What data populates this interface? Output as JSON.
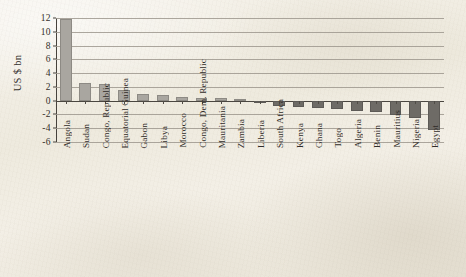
{
  "chart_data": {
    "type": "bar",
    "title": "",
    "subtitle": "",
    "xlabel": "",
    "ylabel": "US $ bn",
    "ylim": [
      -6,
      12
    ],
    "yticks": [
      12,
      10,
      8,
      6,
      4,
      2,
      0,
      -2,
      -4,
      -6
    ],
    "ytick_labels": [
      "12",
      "10",
      "8",
      "6",
      "4",
      "2",
      "0",
      "-2",
      "-4",
      "-6"
    ],
    "grid": true,
    "legend": false,
    "legend_position": "none",
    "categories": [
      "Angola",
      "Sudan",
      "Congo, Republic",
      "Equatorial Guinea",
      "Gabon",
      "Libya",
      "Morocco",
      "Congo, Dem. Republic",
      "Mauritania",
      "Zambia",
      "Liberia",
      "South Africa",
      "Kenya",
      "Ghana",
      "Togo",
      "Algeria",
      "Benin",
      "Mauritius",
      "Nigeria",
      "Egypt"
    ],
    "values": [
      11.8,
      2.6,
      2.4,
      1.5,
      1.0,
      0.8,
      0.6,
      0.45,
      0.35,
      0.2,
      -0.15,
      -0.8,
      -0.9,
      -1.0,
      -1.2,
      -1.5,
      -1.7,
      -2.1,
      -2.5,
      -4.3
    ],
    "positive_color": "#a9a6a0",
    "negative_color": "#6e6b66",
    "axis_color": "#46423c",
    "gridline_color": "#9d988e",
    "background_color": "#f2efe8"
  }
}
